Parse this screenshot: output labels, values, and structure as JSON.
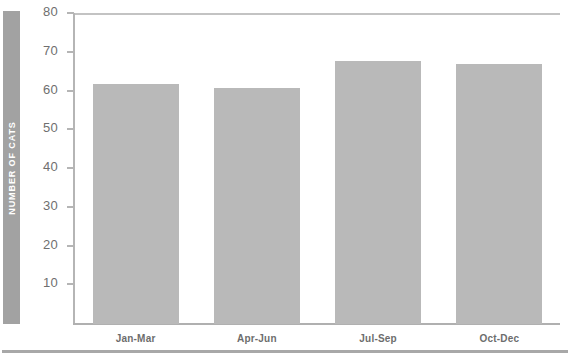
{
  "figure": {
    "cropped_header_text": "",
    "y_axis_title": "NUMBER OF CATS",
    "bar_color": "#b9b9b9",
    "axis_band_color": "#a2a2a2",
    "axis_line_color": "#b5b5b5",
    "label_color": "#6d6d6d"
  },
  "chart_data": {
    "type": "bar",
    "title": "",
    "xlabel": "",
    "ylabel": "NUMBER OF CATS",
    "categories": [
      "Jan-Mar",
      "Apr-Jun",
      "Jul-Sep",
      "Oct-Dec"
    ],
    "values": [
      62,
      61,
      68,
      67
    ],
    "ylim": [
      0,
      80
    ],
    "yticks": [
      10,
      20,
      30,
      40,
      50,
      60,
      70,
      80
    ],
    "ytick_labels": [
      "10",
      "20",
      "30",
      "40",
      "50",
      "60",
      "70",
      "80"
    ],
    "grid": false,
    "legend": null,
    "series": [
      {
        "name": "Number of cats",
        "values": [
          62,
          61,
          68,
          67
        ]
      }
    ]
  }
}
